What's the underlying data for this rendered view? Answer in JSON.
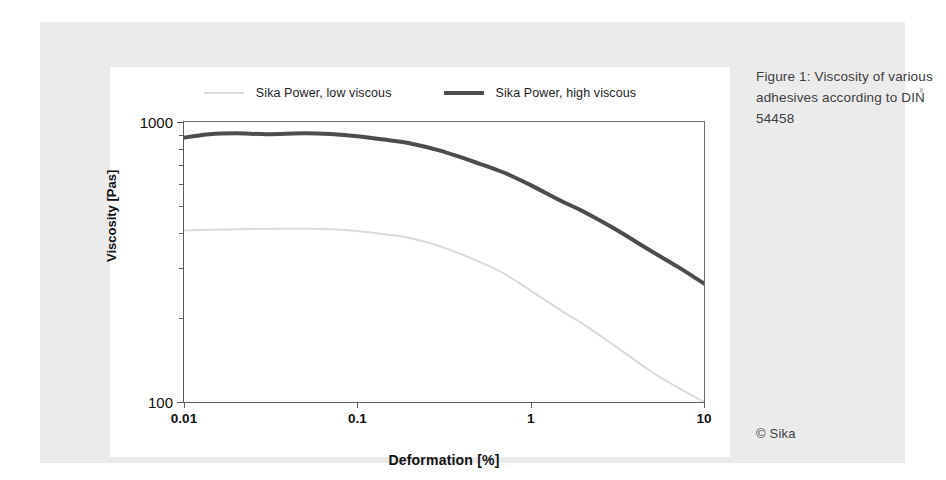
{
  "caption": {
    "text": "Figure 1: Viscosity of various adhesives according to DIN 54458"
  },
  "credit": {
    "text": "© Sika"
  },
  "chart_data": {
    "type": "line",
    "title": "",
    "xlabel": "Deformation [%]",
    "ylabel": "Viscosity [Pas]",
    "xscale": "log",
    "yscale": "log",
    "xlim": [
      0.01,
      10
    ],
    "ylim": [
      100,
      1000
    ],
    "xticks": [
      0.01,
      0.1,
      1,
      10
    ],
    "xtick_labels": [
      "0.01",
      "0.1",
      "1",
      "10"
    ],
    "yticks": [
      100,
      1000
    ],
    "ytick_labels": [
      "100",
      "1000"
    ],
    "yminor_ticks": [
      200,
      300,
      400,
      500,
      600,
      700,
      800,
      900
    ],
    "grid": false,
    "legend_position": "top-center",
    "series": [
      {
        "name": "Sika Power, low viscous",
        "color": "#dadada",
        "linewidth": 2,
        "x": [
          0.01,
          0.014,
          0.02,
          0.03,
          0.05,
          0.07,
          0.1,
          0.15,
          0.2,
          0.3,
          0.5,
          0.7,
          1,
          1.5,
          2,
          3,
          5,
          7,
          10
        ],
        "values": [
          410,
          412,
          414,
          415,
          416,
          414,
          408,
          396,
          385,
          360,
          318,
          288,
          250,
          212,
          190,
          160,
          128,
          113,
          100
        ]
      },
      {
        "name": "Sika Power, high viscous",
        "color": "#4d4d4d",
        "linewidth": 4,
        "x": [
          0.01,
          0.014,
          0.02,
          0.03,
          0.05,
          0.07,
          0.1,
          0.15,
          0.2,
          0.3,
          0.5,
          0.7,
          1,
          1.5,
          2,
          3,
          5,
          7,
          10
        ],
        "values": [
          880,
          905,
          912,
          905,
          912,
          906,
          890,
          862,
          840,
          790,
          712,
          660,
          595,
          522,
          480,
          418,
          345,
          305,
          265
        ]
      }
    ]
  }
}
